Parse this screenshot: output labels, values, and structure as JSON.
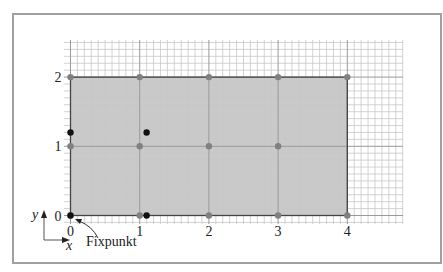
{
  "figure": {
    "frame": {
      "x": 13,
      "y": 14,
      "width": 428,
      "height": 249,
      "stroke": "#a0a0a0"
    },
    "grid": {
      "px_left": 64,
      "px_top": 40,
      "px_right": 403,
      "px_bottom": 224,
      "origin_px": {
        "x": 70.5,
        "y": 215.5
      },
      "unit_px": 69.2,
      "minor_per_unit": 10,
      "minor_color": "#c8c8c8",
      "major_color": "#9a9a9a"
    },
    "region": {
      "x0": 0,
      "y0": 0,
      "x1": 4,
      "y1": 2,
      "fill": "#c9c9c9",
      "stroke": "#444444"
    },
    "x_ticks": [
      {
        "value": 0,
        "label": "0"
      },
      {
        "value": 1,
        "label": "1"
      },
      {
        "value": 2,
        "label": "2"
      },
      {
        "value": 3,
        "label": "3"
      },
      {
        "value": 4,
        "label": "4"
      }
    ],
    "y_ticks": [
      {
        "value": 0,
        "label": "0"
      },
      {
        "value": 1,
        "label": "1"
      },
      {
        "value": 2,
        "label": "2"
      }
    ],
    "gray_points": [
      [
        0,
        0
      ],
      [
        1,
        0
      ],
      [
        2,
        0
      ],
      [
        3,
        0
      ],
      [
        4,
        0
      ],
      [
        0,
        1
      ],
      [
        1,
        1
      ],
      [
        2,
        1
      ],
      [
        3,
        1
      ],
      [
        0,
        2
      ],
      [
        1,
        2
      ],
      [
        2,
        2
      ],
      [
        3,
        2
      ],
      [
        4,
        2
      ]
    ],
    "gray_point_color": "#808080",
    "black_points": [
      [
        0,
        0
      ],
      [
        0,
        1.2
      ],
      [
        1.1,
        1.2
      ],
      [
        1.1,
        0
      ]
    ],
    "black_point_color": "#111111",
    "axis_indicator": {
      "y_label": "y",
      "x_label": "x"
    },
    "annotation": {
      "label": "Fixpunkt",
      "target": [
        0,
        0
      ]
    }
  }
}
